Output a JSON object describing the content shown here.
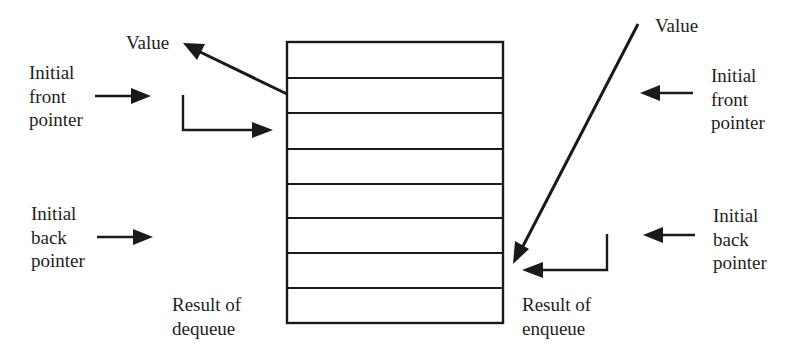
{
  "diagram": {
    "type": "queue-operations",
    "queue": {
      "cell_count": 8,
      "box": {
        "x": 287,
        "y": 42,
        "width": 216,
        "height": 281
      }
    },
    "left_side": {
      "value_label": "Value",
      "front_pointer": {
        "lines": [
          "Initial",
          "front",
          "pointer"
        ]
      },
      "back_pointer": {
        "lines": [
          "Initial",
          "back",
          "pointer"
        ]
      },
      "result": {
        "lines": [
          "Result of",
          "dequeue"
        ]
      }
    },
    "right_side": {
      "value_label": "Value",
      "front_pointer": {
        "lines": [
          "Initial",
          "front",
          "pointer"
        ]
      },
      "back_pointer": {
        "lines": [
          "Initial",
          "back",
          "pointer"
        ]
      },
      "result": {
        "lines": [
          "Result of",
          "enqueue"
        ]
      }
    },
    "colors": {
      "ink": "#1a1a1a",
      "background": "#ffffff"
    }
  }
}
